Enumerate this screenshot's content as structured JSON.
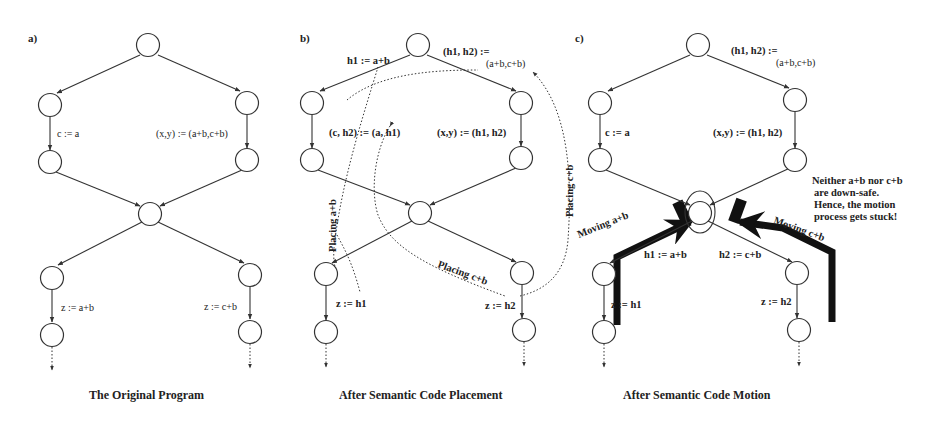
{
  "figure": {
    "panels": [
      {
        "tag": "a)",
        "caption": "The Original Program",
        "labels": {
          "left_mid": "c := a",
          "right_mid": "(x,y) := (a+b,c+b)",
          "left_bottom": "z := a+b",
          "right_bottom": "z := c+b"
        }
      },
      {
        "tag": "b)",
        "caption": "After Semantic Code Placement",
        "labels": {
          "top_left_edge": "h1 := a+b",
          "top_right_edge_1": "(h1, h2) :=",
          "top_right_edge_2": "(a+b,c+b)",
          "left_mid": "(c, h2) := (a, h1)",
          "right_mid": "(x,y) := (h1, h2)",
          "left_bottom": "z := h1",
          "right_bottom": "z := h2",
          "placing_ab": "Placing a+b",
          "placing_cb_right": "Placing c+b",
          "placing_cb_bottom": "Placing c+b"
        }
      },
      {
        "tag": "c)",
        "caption": "After Semantic Code Motion",
        "labels": {
          "top_right_edge_1": "(h1, h2) :=",
          "top_right_edge_2": "(a+b,c+b)",
          "left_mid": "c := a",
          "right_mid": "(x,y) := (h1, h2)",
          "left_lower_edge": "h1 := a+b",
          "right_lower_edge": "h2 := c+b",
          "left_bottom": "z := h1",
          "right_bottom": "z := h2",
          "moving_ab": "Moving a+b",
          "moving_cb": "Moving c+b",
          "note_1": "Neither a+b nor c+b",
          "note_2": "are down-safe.",
          "note_3": "Hence, the motion",
          "note_4": "process gets stuck!"
        }
      }
    ]
  }
}
